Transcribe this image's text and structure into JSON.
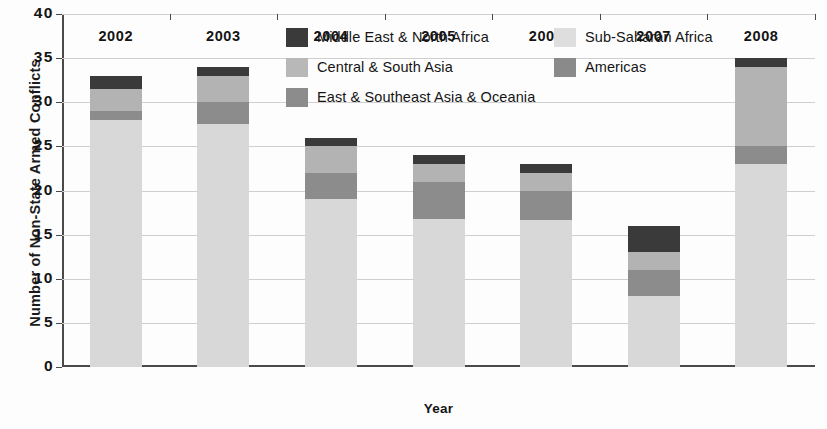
{
  "chart_data": {
    "type": "bar",
    "subtype": "stacked-bar",
    "title": "",
    "xlabel": "Year",
    "ylabel": "Number of Non-State Armed Conflicts",
    "categories": [
      "2002",
      "2003",
      "2004",
      "2005",
      "2006",
      "2007",
      "2008"
    ],
    "ylim": [
      0,
      40
    ],
    "yticks": [
      0,
      5,
      10,
      15,
      20,
      25,
      30,
      35,
      40
    ],
    "ytick_labels": [
      "0",
      "5",
      "10",
      "15",
      "20",
      "25",
      "30",
      "35",
      "40"
    ],
    "grid": true,
    "grid_axis": "y",
    "legend_position": "top-center-inside",
    "stack_order_bottom_to_top": [
      "Sub-Saharan Africa",
      "East & Southeast Asia & Oceania",
      "Central & South Asia",
      "Middle East & North Africa"
    ],
    "series": [
      {
        "name": "Sub-Saharan Africa",
        "color": "#d8d8d8",
        "values": [
          28,
          27.5,
          19,
          16.8,
          16.7,
          8,
          23
        ]
      },
      {
        "name": "East & Southeast Asia & Oceania",
        "color": "#8c8c8c",
        "values": [
          1,
          2.5,
          3,
          4.2,
          3.3,
          3,
          2
        ]
      },
      {
        "name": "Central & South Asia",
        "color": "#b3b3b3",
        "values": [
          2.5,
          3,
          3,
          2,
          2,
          2,
          9
        ]
      },
      {
        "name": "Middle East & North Africa",
        "color": "#3a3a3a",
        "values": [
          1.5,
          1,
          1,
          1,
          1,
          3,
          1
        ]
      }
    ],
    "totals": [
      33,
      34,
      26,
      24,
      23,
      16,
      35
    ]
  },
  "legend": {
    "entries": [
      {
        "label": "Middle East & North Africa",
        "color": "#3a3a3a",
        "column": 0,
        "row": 0
      },
      {
        "label": "Sub-Saharan Africa",
        "color": "#dedede",
        "column": 1,
        "row": 0
      },
      {
        "label": "Central & South Asia",
        "color": "#b8b8b8",
        "column": 0,
        "row": 1
      },
      {
        "label": "Americas",
        "color": "#8a8a8a",
        "column": 1,
        "row": 1
      },
      {
        "label": "East & Southeast Asia & Oceania",
        "color": "#8c8c8c",
        "column": 0,
        "row": 2
      }
    ]
  },
  "axes": {
    "y_title": "Number of Non-State Armed Conflicts",
    "x_title": "Year"
  }
}
